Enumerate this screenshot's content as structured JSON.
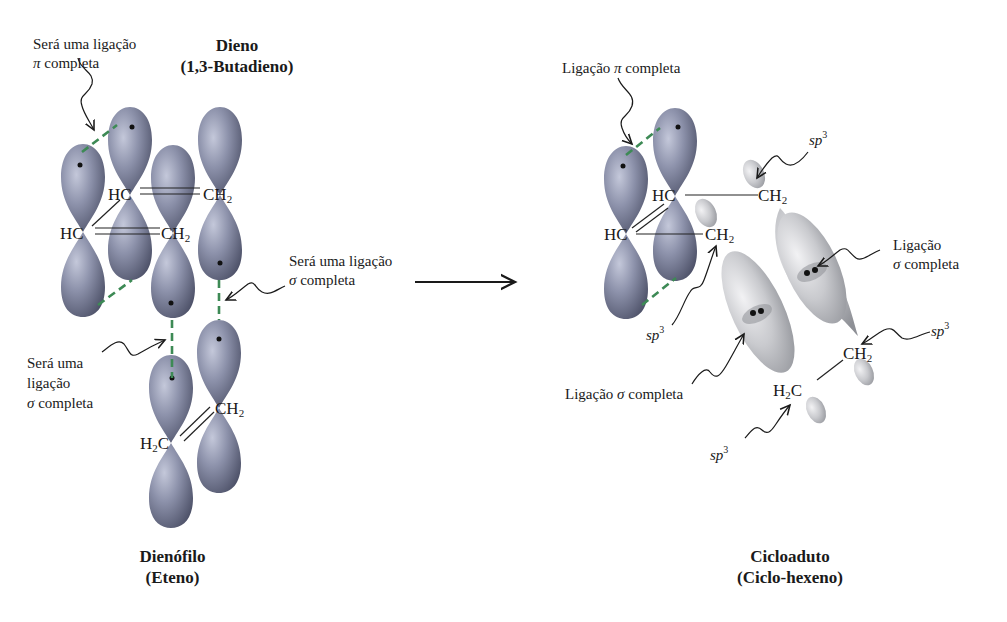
{
  "colors": {
    "p_orbital": "#8d92ab",
    "p_orbital_dark": "#5c6078",
    "sp3_orbital": "#c9cace",
    "new_bond_dash": "#3d8a55",
    "text": "#1a1a1a"
  },
  "reactants": {
    "diene": {
      "title": "Dieno",
      "subtitle": "(1,3-Butadieno)"
    },
    "dienophile": {
      "title": "Dienófilo",
      "subtitle": "(Eteno)"
    },
    "annotations": {
      "pi_future_line1": "Será uma ligação",
      "pi_future_line2": "completa",
      "sigma_future_right_line1": "Será uma ligação",
      "sigma_future_right_line2": "completa",
      "sigma_future_left_line1": "Será uma",
      "sigma_future_left_line2": "ligação",
      "sigma_future_left_line3": "completa"
    },
    "atoms": {
      "hc_top": "HC",
      "ch2_top": "CH",
      "hc_left": "HC",
      "ch2_mid": "CH",
      "ch2_eth": "CH",
      "h2c_eth_h": "H",
      "h2c_eth_c": "C",
      "sub2": "2"
    }
  },
  "arrow": {
    "direction": "right"
  },
  "product": {
    "title": "Cicloaduto",
    "subtitle": "(Ciclo-hexeno)",
    "annotations": {
      "pi_complete": "Ligação",
      "pi_complete_end": "completa",
      "sigma_complete_right_line1": "Ligação",
      "sigma_complete_right_line2": "completa",
      "sigma_complete_left": "Ligação",
      "sigma_complete_left_end": "completa",
      "sp3_label": "sp",
      "sp3_exp": "3"
    },
    "atoms": {
      "hc_top": "HC",
      "ch2_top": "CH",
      "hc_left": "HC",
      "ch2_mid": "CH",
      "ch2_low": "CH",
      "h2c_low_h": "H",
      "h2c_low_c": "C",
      "sub2": "2"
    }
  },
  "symbols": {
    "pi": "π",
    "sigma": "σ"
  }
}
